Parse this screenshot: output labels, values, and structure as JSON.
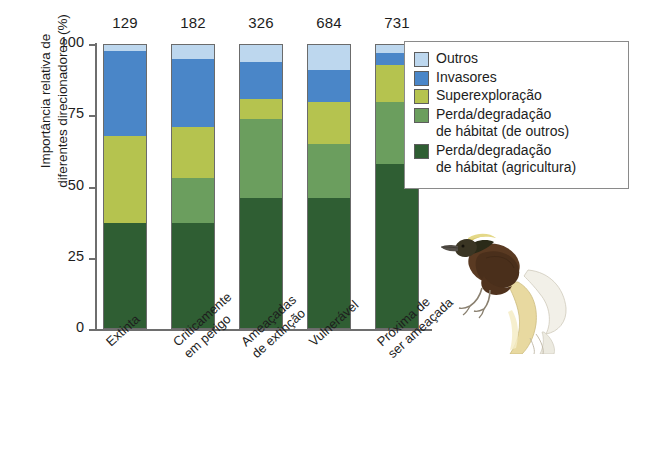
{
  "chart_data": {
    "type": "bar",
    "subtype": "stacked-bar-percent",
    "title": "",
    "xlabel": "",
    "ylabel": "Importância relativa de\ndiferentes direcionadores (%)",
    "ylim": [
      0,
      100
    ],
    "yticks": [
      0,
      25,
      50,
      75,
      100
    ],
    "ytick_labels": [
      "0",
      "25",
      "50",
      "75",
      "100"
    ],
    "grid": false,
    "legend_position": "right",
    "categories": [
      "Extinta",
      "Criticamente\nem perigo",
      "Ameaçadas\nde extinção",
      "Vulnerável",
      "Próxima de\nser ameaçada"
    ],
    "bar_totals": [
      129,
      182,
      326,
      684,
      731
    ],
    "bar_total_note": "Número de espécies indicado acima de cada barra",
    "series": [
      {
        "name": "Perda/degradação\nde hábitat (agricultura)",
        "color": "#2f5e33",
        "values": [
          37,
          37,
          46,
          46,
          58
        ]
      },
      {
        "name": "Perda/degradação\nde hábitat (de outros)",
        "color": "#6b9e5e",
        "values": [
          0,
          16,
          28,
          19,
          22
        ]
      },
      {
        "name": "Superexploração",
        "color": "#b5c34f",
        "values": [
          31,
          18,
          7,
          15,
          13
        ]
      },
      {
        "name": "Invasores",
        "color": "#4a86c8",
        "values": [
          30,
          24,
          13,
          11,
          4
        ]
      },
      {
        "name": "Outros",
        "color": "#bdd7ee",
        "values": [
          2,
          5,
          6,
          9,
          3
        ]
      }
    ]
  },
  "legend": {
    "items": [
      {
        "label": "Outros",
        "color": "#bdd7ee"
      },
      {
        "label": "Invasores",
        "color": "#4a86c8"
      },
      {
        "label": "Superexploração",
        "color": "#b5c34f"
      },
      {
        "label": "Perda/degradação\nde hábitat (de outros)",
        "color": "#6b9e5e"
      },
      {
        "label": "Perda/degradação\nde hábitat (agricultura)",
        "color": "#2f5e33"
      }
    ]
  },
  "illustration": {
    "name": "bird-of-paradise",
    "colors": {
      "body": "#5a3a22",
      "wing": "#4a2f1b",
      "crown": "#d8c86a",
      "nape": "#2a2a18",
      "beak": "#555049",
      "plume_yellow": "#e8d9a0",
      "plume_white": "#f2f0e8",
      "feet": "#8a8070"
    }
  }
}
